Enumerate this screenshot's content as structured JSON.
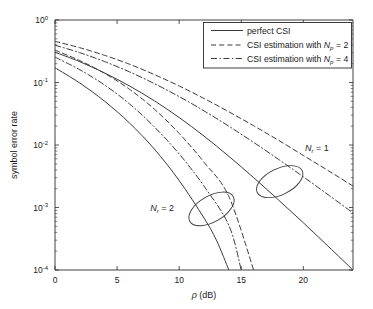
{
  "chart_data": {
    "type": "line",
    "title": "",
    "xlabel": "ρ (dB)",
    "ylabel": "symbol error rate",
    "xlim": [
      0,
      24
    ],
    "ylim": [
      0.0001,
      1
    ],
    "yscale": "log",
    "grid": false,
    "xticks": [
      0,
      5,
      10,
      15,
      20
    ],
    "xtick_labels": [
      "0",
      "5",
      "10",
      "15",
      "20"
    ],
    "yticks": [
      1,
      0.1,
      0.01,
      0.001,
      0.0001
    ],
    "ytick_labels": [
      "10^0",
      "10^-1",
      "10^-2",
      "10^-3",
      "10^-4"
    ],
    "ytick_bases": [
      "10",
      "10",
      "10",
      "10",
      "10"
    ],
    "ytick_exponents": [
      "0",
      "-1",
      "-2",
      "-3",
      "-4"
    ],
    "legend_position": "upper right",
    "series": [
      {
        "name": "perfect CSI, Nr = 1",
        "style": "solid",
        "group": "Nr=1",
        "x": [
          0,
          2,
          4,
          6,
          8,
          10,
          12,
          14,
          16,
          18,
          20,
          22,
          24
        ],
        "y": [
          0.305,
          0.215,
          0.142,
          0.088,
          0.051,
          0.0275,
          0.0139,
          0.0066,
          0.003,
          0.00132,
          0.00057,
          0.00024,
          0.0001
        ]
      },
      {
        "name": "CSI estimation with Np = 4, Nr = 1",
        "style": "dashdot",
        "group": "Nr=1",
        "x": [
          0,
          2,
          4,
          6,
          8,
          10,
          12,
          14,
          16,
          18,
          20,
          22,
          24
        ],
        "y": [
          0.395,
          0.3,
          0.216,
          0.148,
          0.096,
          0.0595,
          0.0352,
          0.02,
          0.011,
          0.0059,
          0.0031,
          0.0016,
          0.00082
        ]
      },
      {
        "name": "CSI estimation with Np = 2, Nr = 1",
        "style": "dashed",
        "group": "Nr=1",
        "x": [
          0,
          2,
          4,
          6,
          8,
          10,
          12,
          14,
          16,
          18,
          20,
          22,
          24
        ],
        "y": [
          0.455,
          0.36,
          0.272,
          0.196,
          0.134,
          0.088,
          0.0555,
          0.034,
          0.0203,
          0.0119,
          0.0068,
          0.0039,
          0.0022
        ]
      },
      {
        "name": "perfect CSI, Nr = 2",
        "style": "solid",
        "group": "Nr=2",
        "x": [
          0,
          2,
          4,
          6,
          8,
          10,
          12,
          13,
          14
        ],
        "y": [
          0.172,
          0.098,
          0.05,
          0.0225,
          0.0086,
          0.0027,
          0.00068,
          0.0003,
          0.0001
        ]
      },
      {
        "name": "CSI estimation with Np = 4, Nr = 2",
        "style": "dashdot",
        "group": "Nr=2",
        "x": [
          0,
          2,
          4,
          6,
          8,
          10,
          12,
          14,
          15
        ],
        "y": [
          0.255,
          0.16,
          0.091,
          0.0455,
          0.0195,
          0.0072,
          0.0022,
          0.00052,
          0.0001
        ]
      },
      {
        "name": "CSI estimation with Np = 2, Nr = 2",
        "style": "dashed",
        "group": "Nr=2",
        "x": [
          0,
          2,
          4,
          6,
          8,
          10,
          12,
          14,
          16
        ],
        "y": [
          0.33,
          0.224,
          0.14,
          0.078,
          0.0375,
          0.0153,
          0.0053,
          0.0015,
          0.0001
        ]
      }
    ],
    "annotations": [
      {
        "name": "nr-1",
        "text_base": "N",
        "text_sub": "r",
        "text_rest": " = 1",
        "ellipse_center_x": 18.1,
        "ellipse_center_y": 0.0026
      },
      {
        "name": "nr-2",
        "text_base": "N",
        "text_sub": "r",
        "text_rest": " = 2",
        "ellipse_center_x": 12.6,
        "ellipse_center_y": 0.00095
      }
    ]
  },
  "legend": {
    "entries": [
      {
        "label": "perfect CSI",
        "style": "solid",
        "sub": "",
        "suffix": ""
      },
      {
        "label": "CSI estimation with ",
        "style": "dashed",
        "base": "N",
        "sub": "p",
        "suffix": " = 2"
      },
      {
        "label": "CSI estimation with ",
        "style": "dashdot",
        "base": "N",
        "sub": "p",
        "suffix": " = 4"
      }
    ]
  },
  "axes": {
    "xlabel_symbol": "ρ",
    "xlabel_unit": " (dB)",
    "ylabel": "symbol error rate"
  },
  "colors": {
    "axis": "#2b2b2b",
    "curve": "#3a3a3a",
    "background": "#ffffff"
  }
}
